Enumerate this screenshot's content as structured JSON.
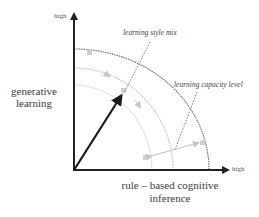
{
  "diagram": {
    "y_axis": {
      "end_label": "high",
      "title_lines": [
        "generative",
        "learning"
      ]
    },
    "x_axis": {
      "end_label": "high",
      "title_lines": [
        "rule – based cognitive",
        "inference"
      ]
    },
    "annotations": {
      "learning_style_mix": "learning style mix",
      "learning_capacity_level": "learning capacity level"
    },
    "elements": {
      "arcs": [
        {
          "name": "inner-arc",
          "style": "faint solid",
          "color": "#d8d8d8"
        },
        {
          "name": "middle-arc",
          "style": "dotted with arrows",
          "color": "#b8b8b8"
        },
        {
          "name": "outer-arc",
          "style": "dotted",
          "color": "#6a6a6a"
        }
      ],
      "vector": {
        "name": "main-vector-arrow",
        "color": "#1a1a1a"
      },
      "capacity_arrow": {
        "name": "capacity-double-arrow",
        "color": "#c4c4c4"
      }
    },
    "colors": {
      "axis": "#222222",
      "marker": "#c8c8c8"
    }
  }
}
